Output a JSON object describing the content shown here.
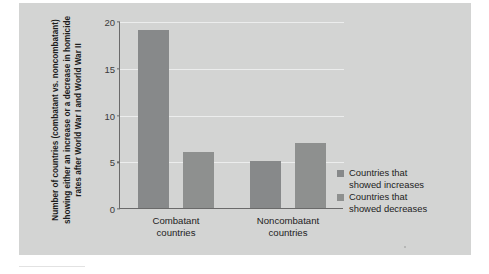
{
  "chart_data": {
    "type": "bar",
    "title": "",
    "subtitle": "",
    "xlabel": "",
    "ylabel": "Number of countries (combatant vs. noncombatant) showing either an increase or a decrease in homicide rates after World War I and World War II",
    "categories": [
      "Combatant countries",
      "Noncombatant countries"
    ],
    "category_lines": [
      [
        "Combatant",
        "countries"
      ],
      [
        "Noncombatant",
        "countries"
      ]
    ],
    "series": [
      {
        "name": "Countries that showed increases",
        "values": [
          19,
          5
        ],
        "color": "#87898a"
      },
      {
        "name": "Countries that showed decreases",
        "values": [
          6,
          7
        ],
        "color": "#8e908f"
      }
    ],
    "ylim": [
      0,
      20
    ],
    "yticks": [
      0,
      5,
      10,
      15,
      20
    ],
    "ytick_labels": [
      "0",
      "5",
      "10",
      "15",
      "20"
    ],
    "grid": true,
    "grid_color": "#eceded",
    "legend_position": "right",
    "panel_color": "#d3d4d3",
    "axis_color": "#6a6a6a",
    "background": "#ffffff"
  },
  "legend": {
    "items": [
      {
        "label_line1": "Countries that",
        "label_line2": "showed increases"
      },
      {
        "label_line1": "Countries that",
        "label_line2": "showed decreases"
      }
    ]
  }
}
